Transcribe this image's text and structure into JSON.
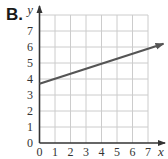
{
  "label": "B.",
  "chart_data": {
    "type": "line",
    "title": "",
    "xlabel": "x",
    "ylabel": "y",
    "xlim": [
      0,
      7
    ],
    "ylim": [
      0,
      8
    ],
    "grid": true,
    "x_ticks": [
      "0",
      "1",
      "2",
      "3",
      "4",
      "5",
      "6",
      "7"
    ],
    "y_ticks": [
      "1",
      "2",
      "3",
      "4",
      "5",
      "6",
      "7"
    ],
    "series": [
      {
        "name": "line",
        "x": [
          0,
          8
        ],
        "y": [
          3.7,
          6.2
        ],
        "arrow_end": true,
        "color": "#555555"
      }
    ],
    "legend": null
  },
  "colors": {
    "grid": "#cccccc",
    "axis": "#333333",
    "line": "#555555"
  }
}
